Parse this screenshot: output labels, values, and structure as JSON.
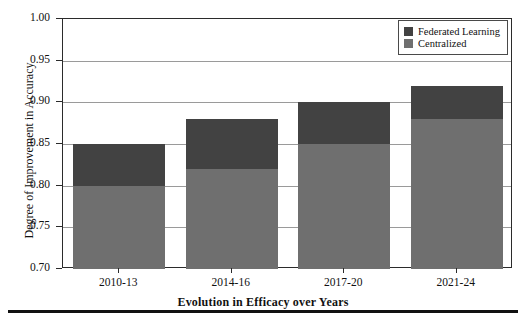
{
  "chart_data": {
    "type": "bar",
    "subtype": "stacked-bar",
    "title": "",
    "xlabel": "Evolution in Efficacy over Years",
    "ylabel": "Degree of Improvement in Accuracy",
    "categories": [
      "2010-13",
      "2014-16",
      "2017-20",
      "2021-24"
    ],
    "series": [
      {
        "name": "Centralized",
        "color": "#6f6f6f",
        "values": [
          0.8,
          0.82,
          0.85,
          0.88
        ]
      },
      {
        "name": "Federated Learning",
        "color": "#424242",
        "values": [
          0.85,
          0.88,
          0.9,
          0.92
        ]
      }
    ],
    "stack_tops": [
      0.85,
      0.88,
      0.9,
      0.92
    ],
    "ylim": [
      0.7,
      1.0
    ],
    "yticks": [
      "1.00",
      "0.95",
      "0.90",
      "0.85",
      "0.80",
      "0.75",
      "0.70"
    ],
    "ytick_values": [
      1.0,
      0.95,
      0.9,
      0.85,
      0.8,
      0.75,
      0.7
    ],
    "grid": true,
    "grid_axis": "y",
    "legend_position": "top-right",
    "legend_entries": [
      "Federated Learning",
      "Centralized"
    ]
  },
  "axes": {
    "y_title": "Degree of Improvement in Accuracy",
    "x_title": "Evolution in Efficacy over Years"
  },
  "legend": {
    "items": [
      {
        "label": "Federated Learning",
        "color": "#424242"
      },
      {
        "label": "Centralized",
        "color": "#6f6f6f"
      }
    ]
  }
}
